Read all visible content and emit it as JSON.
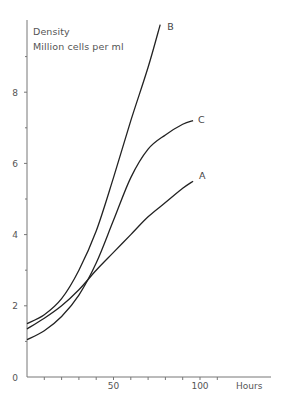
{
  "chart_data": {
    "type": "line",
    "title": "",
    "ylabel_line1": "Density",
    "ylabel_line2": "Million cells per ml",
    "xlabel": "Hours",
    "xlim": [
      0,
      140
    ],
    "ylim": [
      0,
      10
    ],
    "x_tick_labels": [
      {
        "value": 50,
        "label": "50"
      },
      {
        "value": 100,
        "label": "100"
      }
    ],
    "x_minor_ticks": [
      10,
      20,
      30,
      40,
      50,
      60,
      70,
      80,
      90,
      100,
      110
    ],
    "y_tick_labels": [
      {
        "value": 0,
        "label": "0"
      },
      {
        "value": 2,
        "label": "2"
      },
      {
        "value": 4,
        "label": "4"
      },
      {
        "value": 6,
        "label": "6"
      },
      {
        "value": 8,
        "label": "8"
      }
    ],
    "y_minor_ticks": [
      1,
      3,
      5,
      7,
      9
    ],
    "grid": false,
    "legend": "inline labels at curve ends",
    "series": [
      {
        "name": "B",
        "x": [
          0,
          10,
          20,
          30,
          40,
          50,
          60,
          70,
          77
        ],
        "values": [
          1.5,
          1.75,
          2.2,
          3.0,
          4.1,
          5.6,
          7.2,
          8.7,
          9.9
        ]
      },
      {
        "name": "C",
        "x": [
          0,
          10,
          20,
          30,
          40,
          50,
          60,
          70,
          80,
          90,
          96
        ],
        "values": [
          1.05,
          1.3,
          1.7,
          2.3,
          3.2,
          4.4,
          5.6,
          6.4,
          6.8,
          7.1,
          7.2
        ]
      },
      {
        "name": "A",
        "x": [
          0,
          10,
          20,
          30,
          40,
          50,
          60,
          70,
          80,
          90,
          96
        ],
        "values": [
          1.35,
          1.65,
          2.0,
          2.45,
          3.0,
          3.5,
          4.0,
          4.5,
          4.9,
          5.3,
          5.5
        ]
      }
    ]
  },
  "colors": {
    "axis": "#777777",
    "curve": "#222222",
    "text": "#555555"
  }
}
